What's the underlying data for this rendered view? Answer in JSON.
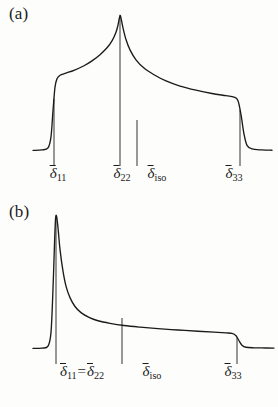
{
  "figure": {
    "background_color": "#fdfdfc",
    "line_color": "#1b1b1b",
    "width": 278,
    "height": 407
  },
  "panels": [
    {
      "id": "a",
      "label": "(a)",
      "description": "Asymmetric CSA powder pattern with three distinct principal values",
      "ticks": [
        {
          "name": "delta-11",
          "symbol": "δ",
          "subscript": "11",
          "x": 54,
          "label_x": 58
        },
        {
          "name": "delta-22",
          "symbol": "δ",
          "subscript": "22",
          "x": 120,
          "label_x": 122
        },
        {
          "name": "delta-iso",
          "symbol": "δ",
          "subscript": "iso",
          "x": 137,
          "label_x": 157
        },
        {
          "name": "delta-33",
          "symbol": "δ",
          "subscript": "33",
          "x": 240,
          "label_x": 234
        }
      ]
    },
    {
      "id": "b",
      "label": "(b)",
      "description": "Axially symmetric CSA powder pattern where delta-11 equals delta-22",
      "ticks": [
        {
          "name": "delta-11-eq-delta-22",
          "symbol": "δ",
          "subscript": "11",
          "symbol2": "δ",
          "subscript2": "22",
          "equals": "=",
          "x": 56,
          "label_x": 82
        },
        {
          "name": "delta-iso",
          "symbol": "δ",
          "subscript": "iso",
          "x": 122,
          "label_x": 152
        },
        {
          "name": "delta-33",
          "symbol": "δ",
          "subscript": "33",
          "x": 237,
          "label_x": 233
        }
      ]
    }
  ],
  "chart_data": [
    {
      "type": "line",
      "panel": "a",
      "title": "(a)",
      "xlabel": "",
      "ylabel": "",
      "grid": false,
      "legend": null,
      "axis_ranges": {
        "xlim": [
          30,
          278
        ],
        "ylim": [
          0,
          1
        ]
      },
      "annotations": [
        {
          "text": "δ̄₁₁",
          "x": 54
        },
        {
          "text": "δ̄₂₂",
          "x": 120
        },
        {
          "text": "δ̄iso",
          "x": 137
        },
        {
          "text": "δ̄₃₃",
          "x": 240
        }
      ],
      "points": [
        [
          33,
          0.012
        ],
        [
          42,
          0.015
        ],
        [
          48,
          0.03
        ],
        [
          51,
          0.11
        ],
        [
          53,
          0.3
        ],
        [
          55,
          0.47
        ],
        [
          57,
          0.53
        ],
        [
          60,
          0.556
        ],
        [
          66,
          0.572
        ],
        [
          74,
          0.592
        ],
        [
          84,
          0.625
        ],
        [
          92,
          0.66
        ],
        [
          100,
          0.705
        ],
        [
          107,
          0.755
        ],
        [
          112,
          0.805
        ],
        [
          116,
          0.868
        ],
        [
          118,
          0.92
        ],
        [
          119.5,
          0.975
        ],
        [
          120.5,
          0.985
        ],
        [
          123,
          0.9
        ],
        [
          126,
          0.815
        ],
        [
          130,
          0.74
        ],
        [
          136,
          0.668
        ],
        [
          144,
          0.608
        ],
        [
          154,
          0.56
        ],
        [
          166,
          0.515
        ],
        [
          180,
          0.478
        ],
        [
          196,
          0.448
        ],
        [
          212,
          0.424
        ],
        [
          226,
          0.408
        ],
        [
          234,
          0.398
        ],
        [
          238,
          0.372
        ],
        [
          241,
          0.27
        ],
        [
          244,
          0.13
        ],
        [
          247,
          0.048
        ],
        [
          252,
          0.022
        ],
        [
          262,
          0.015
        ],
        [
          272,
          0.013
        ]
      ]
    },
    {
      "type": "line",
      "panel": "b",
      "title": "(b)",
      "xlabel": "",
      "ylabel": "",
      "grid": false,
      "legend": null,
      "axis_ranges": {
        "xlim": [
          30,
          278
        ],
        "ylim": [
          0,
          1
        ]
      },
      "annotations": [
        {
          "text": "δ̄₁₁=δ̄₂₂",
          "x": 56
        },
        {
          "text": "δ̄iso",
          "x": 122
        },
        {
          "text": "δ̄₃₃",
          "x": 237
        }
      ],
      "points": [
        [
          33,
          0.012
        ],
        [
          42,
          0.014
        ],
        [
          48,
          0.028
        ],
        [
          51,
          0.13
        ],
        [
          53,
          0.45
        ],
        [
          54.5,
          0.78
        ],
        [
          55.5,
          0.96
        ],
        [
          56.5,
          0.985
        ],
        [
          58,
          0.9
        ],
        [
          60,
          0.74
        ],
        [
          63,
          0.58
        ],
        [
          66,
          0.47
        ],
        [
          70,
          0.385
        ],
        [
          75,
          0.32
        ],
        [
          81,
          0.275
        ],
        [
          89,
          0.24
        ],
        [
          98,
          0.215
        ],
        [
          110,
          0.196
        ],
        [
          124,
          0.18
        ],
        [
          140,
          0.168
        ],
        [
          158,
          0.157
        ],
        [
          178,
          0.147
        ],
        [
          198,
          0.138
        ],
        [
          214,
          0.131
        ],
        [
          226,
          0.126
        ],
        [
          232,
          0.122
        ],
        [
          236,
          0.105
        ],
        [
          239,
          0.068
        ],
        [
          242,
          0.035
        ],
        [
          246,
          0.02
        ],
        [
          254,
          0.016
        ],
        [
          266,
          0.015
        ],
        [
          274,
          0.014
        ]
      ]
    }
  ]
}
